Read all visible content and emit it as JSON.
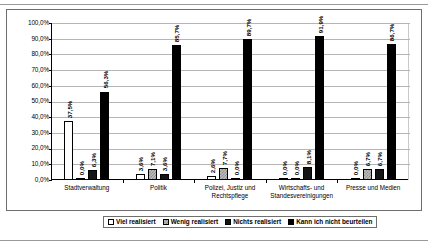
{
  "chart_data": {
    "type": "bar",
    "title": "",
    "xlabel": "",
    "ylabel": "",
    "ylim": [
      0,
      100
    ],
    "grid": true,
    "legend_position": "bottom",
    "categories": [
      "Stadtverwaltung",
      "Politik",
      "Polizei, Justiz und Rechtspflege",
      "Wirtschafts- und Standesvereinigungen",
      "Presse und Medien"
    ],
    "ytick_labels": [
      "100,0%",
      "90,0%",
      "80,0%",
      "70,0%",
      "60,0%",
      "50,0%",
      "40,0%",
      "30,0%",
      "20,0%",
      "10,0%",
      "0,0%"
    ],
    "series": [
      {
        "name": "Viel realisiert",
        "color": "#ffffff",
        "values": [
          37.5,
          3.6,
          2.6,
          0.0,
          0.0
        ],
        "labels": [
          "37,5%",
          "3,6%",
          "2,6%",
          "0,0%",
          "0,0%"
        ]
      },
      {
        "name": "Wenig realisiert",
        "color": "#bdbdbd",
        "values": [
          0.0,
          7.1,
          7.7,
          0.0,
          6.7
        ],
        "labels": [
          "0,0%",
          "7,1%",
          "7,7%",
          "0,0%",
          "6,7%"
        ]
      },
      {
        "name": "Nichts realisiert",
        "color": "#141414",
        "values": [
          6.3,
          3.6,
          0.0,
          8.1,
          6.7
        ],
        "labels": [
          "6,3%",
          "3,6%",
          "0,0%",
          "8,1%",
          "6,7%"
        ]
      },
      {
        "name": "Kann ich nicht beurteilen",
        "color": "#000000",
        "values": [
          56.3,
          85.7,
          89.7,
          91.9,
          86.7
        ],
        "labels": [
          "56,3%",
          "85,7%",
          "89,7%",
          "91,9%",
          "86,7%"
        ]
      }
    ]
  },
  "category_lines": [
    [
      "Stadtverwaltung"
    ],
    [
      "Politik"
    ],
    [
      "Polizei, Justiz und",
      "Rechtspflege"
    ],
    [
      "Wirtschafts- und",
      "Standesvereinigungen"
    ],
    [
      "Presse und Medien"
    ]
  ]
}
